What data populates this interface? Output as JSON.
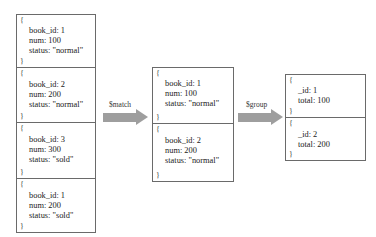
{
  "input_documents": [
    {
      "fields": [
        "book_id: 1",
        "num: 100",
        "status: \"normal\""
      ]
    },
    {
      "fields": [
        "book_id: 2",
        "num: 200",
        "status: \"normal\""
      ]
    },
    {
      "fields": [
        "book_id: 3",
        "num: 300",
        "status: \"sold\""
      ]
    },
    {
      "fields": [
        "book_id: 1",
        "num: 200",
        "status: \"sold\""
      ]
    }
  ],
  "match_stage": {
    "label": "$match",
    "documents": [
      {
        "fields": [
          "book_id: 1",
          "num: 100",
          "status: \"normal\""
        ]
      },
      {
        "fields": [
          "book_id: 2",
          "num: 200",
          "status: \"normal\""
        ]
      }
    ]
  },
  "group_stage": {
    "label": "$group",
    "documents": [
      {
        "fields": [
          "_id: 1",
          "total: 100"
        ]
      },
      {
        "fields": [
          "_id: 2",
          "total: 200"
        ]
      }
    ]
  },
  "braces": {
    "open": "{",
    "close": "}"
  },
  "colors": {
    "border": "#6a6a6a",
    "arrow": "#9e9e9e",
    "text": "#222222"
  }
}
